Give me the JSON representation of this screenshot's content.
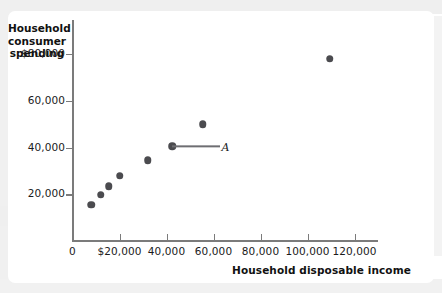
{
  "figure": {
    "axis_title_y_lines": [
      "Household",
      "consumer",
      "spending"
    ],
    "axis_title_x": "Household disposable income",
    "point_label": "A"
  },
  "chart_data": {
    "type": "scatter",
    "title": "",
    "xlabel": "Household disposable income",
    "ylabel": "Household consumer spending",
    "xlim": [
      0,
      130000
    ],
    "ylim": [
      0,
      92000
    ],
    "grid": false,
    "legend": null,
    "x_ticks": [
      {
        "value": 0,
        "label": "0"
      },
      {
        "value": 20000,
        "label": "$20,000"
      },
      {
        "value": 40000,
        "label": "40,000"
      },
      {
        "value": 60000,
        "label": "60,000"
      },
      {
        "value": 80000,
        "label": "80,000"
      },
      {
        "value": 100000,
        "label": "100,000"
      },
      {
        "value": 120000,
        "label": "120,000"
      }
    ],
    "y_ticks": [
      {
        "value": 20000,
        "label": "20,000"
      },
      {
        "value": 40000,
        "label": "40,000"
      },
      {
        "value": 60000,
        "label": "60,000"
      },
      {
        "value": 80000,
        "label": "$80,000"
      }
    ],
    "points": [
      {
        "x": 8000,
        "y": 15500,
        "label": ""
      },
      {
        "x": 12000,
        "y": 19800,
        "label": ""
      },
      {
        "x": 15500,
        "y": 23500,
        "label": ""
      },
      {
        "x": 20000,
        "y": 28000,
        "label": ""
      },
      {
        "x": 32000,
        "y": 34500,
        "label": ""
      },
      {
        "x": 42500,
        "y": 40500,
        "label": "A"
      },
      {
        "x": 55500,
        "y": 50000,
        "label": ""
      },
      {
        "x": 109500,
        "y": 78000,
        "label": ""
      }
    ],
    "annotations": [
      {
        "text": "A",
        "for_point_index": 5,
        "leader_line": true
      }
    ],
    "colors": {
      "marker": "#4b4b4f",
      "axis": "#7b7b7b",
      "text": "#1b1b1b",
      "background": "#ffffff"
    }
  }
}
